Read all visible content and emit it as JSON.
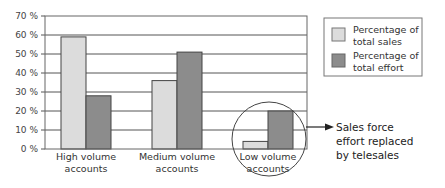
{
  "chart_data": {
    "type": "bar",
    "title": "",
    "xlabel": "",
    "ylabel": "",
    "ylim": [
      0,
      70
    ],
    "yticks": [
      "0 %",
      "10 %",
      "20 %",
      "30 %",
      "40 %",
      "50 %",
      "60 %",
      "70 %"
    ],
    "grid": true,
    "categories": [
      [
        "High volume",
        "accounts"
      ],
      [
        "Medium volume",
        "accounts"
      ],
      [
        "Low volume",
        "accounts"
      ]
    ],
    "series": [
      {
        "name": "Percentage of total sales",
        "legend_lines": [
          "Percentage of",
          "total sales"
        ],
        "color": "#dcdcdc",
        "values": [
          59,
          36,
          4
        ]
      },
      {
        "name": "Percentage of total effort",
        "legend_lines": [
          "Percentage of",
          "total effort"
        ],
        "color": "#8c8c8c",
        "values": [
          28,
          51,
          20
        ]
      }
    ],
    "legend_position": "upper right, outside plot",
    "annotation": {
      "target_category": "Low volume accounts",
      "shape": "circle",
      "lines": [
        "Sales force",
        "effort replaced",
        "by telesales"
      ]
    }
  }
}
